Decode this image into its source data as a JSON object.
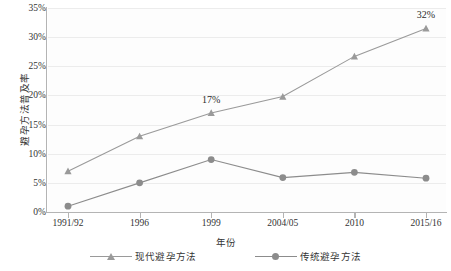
{
  "chart_data": {
    "type": "line",
    "title": "",
    "xlabel": "年份",
    "ylabel": "避孕方法普及率",
    "categories": [
      "1991/92",
      "1996",
      "1999",
      "2004/05",
      "2010",
      "2015/16"
    ],
    "ylim": [
      0,
      35
    ],
    "ytick_labels": [
      "0%",
      "5%",
      "10%",
      "15%",
      "20%",
      "25%",
      "30%",
      "35%"
    ],
    "ytick_values": [
      0,
      5,
      10,
      15,
      20,
      25,
      30,
      35
    ],
    "grid": true,
    "legend_position": "bottom",
    "series": [
      {
        "name": "现代避孕方法",
        "marker": "triangle",
        "color": "#9a9a9a",
        "values": [
          7.0,
          13.0,
          17.0,
          19.8,
          26.7,
          31.5
        ],
        "point_labels": [
          null,
          null,
          "17%",
          null,
          null,
          "32%"
        ]
      },
      {
        "name": "传统避孕方法",
        "marker": "circle",
        "color": "#8c8c8c",
        "values": [
          1.0,
          5.0,
          9.0,
          5.9,
          6.8,
          5.8
        ],
        "point_labels": [
          null,
          null,
          null,
          null,
          null,
          null
        ]
      }
    ],
    "annotations": [
      {
        "text": "17%",
        "series": "现代避孕方法",
        "category": "1999"
      },
      {
        "text": "32%",
        "series": "现代避孕方法",
        "category": "2015/16"
      }
    ]
  },
  "colors": {
    "axis": "#b4b4b4",
    "grid": "#ececec",
    "text": "#333333",
    "series_modern": "#9a9a9a",
    "series_traditional": "#8c8c8c",
    "plot_background": "#fdfdfd"
  }
}
